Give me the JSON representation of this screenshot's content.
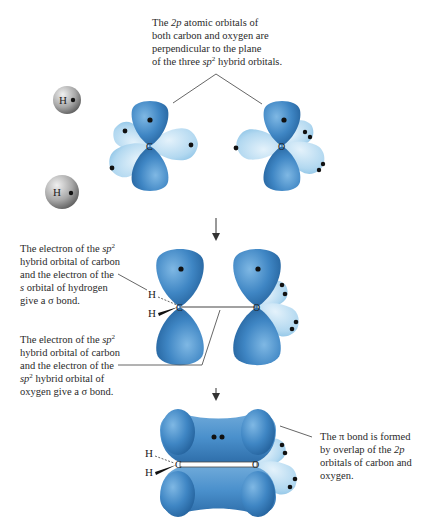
{
  "captions": {
    "top": {
      "l1a": "The ",
      "l1b": "2p",
      "l1c": " atomic orbitals of",
      "l2": "both carbon and oxygen are",
      "l3": "perpendicular to the plane",
      "l4a": "of the three ",
      "l4b": "sp",
      "l4sup": "2",
      "l4c": " hybrid orbitals."
    },
    "sigma_ch": {
      "l1a": "The electron of the ",
      "l1b": "sp",
      "l1sup": "2",
      "l2": "hybrid orbital of carbon",
      "l3": "and the electron of the",
      "l4a": "s",
      "l4b": " orbital of hydrogen",
      "l5": "give a σ bond."
    },
    "sigma_co": {
      "l1a": "The electron of the ",
      "l1b": "sp",
      "l1sup": "2",
      "l2": "hybrid orbital of carbon",
      "l3": "and the electron of the",
      "l4a": "sp",
      "l4sup": "2",
      "l4b": " hybrid orbital of",
      "l5": "oxygen give a σ bond."
    },
    "pi": {
      "l1": "The π bond is formed",
      "l2a": "by overlap of the ",
      "l2b": "2p",
      "l3": "orbitals of carbon and",
      "l4": "oxygen."
    }
  },
  "atoms": {
    "hydrogen": "H",
    "carbon": "C",
    "oxygen": "O"
  },
  "colors": {
    "p_orbital": "#3f86c4",
    "sp2_orbital": "#a9d3ee",
    "hydrogen": "#9a9a9a",
    "electron": "#111111",
    "leader_line": "#555555"
  },
  "stages": [
    {
      "name": "separate-atoms",
      "description": "2 H atoms, sp2 carbon, sp2 oxygen"
    },
    {
      "name": "sigma-bonds",
      "description": "C-H and C-O sigma bonds formed"
    },
    {
      "name": "pi-bond",
      "description": "pi bond from 2p overlap"
    }
  ]
}
